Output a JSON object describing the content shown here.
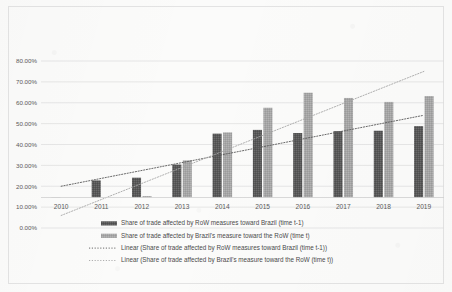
{
  "chart_data": {
    "type": "bar",
    "title": "",
    "xlabel": "",
    "ylabel": "",
    "ylim": [
      0,
      80
    ],
    "ytick_labels": [
      "0.00%",
      "10.00%",
      "20.00%",
      "30.00%",
      "40.00%",
      "50.00%",
      "60.00%",
      "70.00%",
      "80.00%"
    ],
    "ytick_values": [
      0,
      10,
      20,
      30,
      40,
      50,
      60,
      70,
      80
    ],
    "grid": true,
    "legend_position": "bottom",
    "categories": [
      "2010",
      "2011",
      "2012",
      "2013",
      "2014",
      "2015",
      "2016",
      "2017",
      "2018",
      "2019"
    ],
    "series": [
      {
        "name": "Share of trade affected by RoW measures toward Brazil (time t-1)",
        "type": "bar",
        "color": "#595959",
        "values": [
          14.7,
          22.8,
          24.1,
          30.4,
          45.2,
          47.0,
          45.5,
          46.4,
          46.6,
          48.8
        ]
      },
      {
        "name": "Share of trade affected by Brazil's measure toward the RoW (time t)",
        "type": "bar",
        "color": "#a6a6a6",
        "values": [
          3.8,
          6.5,
          15.3,
          32.4,
          45.8,
          57.6,
          64.8,
          62.3,
          60.4,
          63.2
        ]
      },
      {
        "name": "Linear (Share of trade affected by RoW measures toward Brazil (time t-1))",
        "type": "trendline",
        "color": "#595959",
        "style": "dotted",
        "endpoints": [
          20.0,
          54.0
        ]
      },
      {
        "name": "Linear (Share of trade affected by Brazil's measure toward the RoW (time t))",
        "type": "trendline",
        "color": "#a6a6a6",
        "style": "dotted",
        "endpoints": [
          6.0,
          75.0
        ]
      }
    ]
  },
  "legend": {
    "items": [
      {
        "label": "Share of trade affected by RoW measures toward Brazil (time t-1)",
        "marker": "bar-swatch",
        "color": "#595959"
      },
      {
        "label": "Share of trade affected by Brazil's measure toward the RoW (time t)",
        "marker": "bar-swatch",
        "color": "#a6a6a6"
      },
      {
        "label": "Linear (Share of trade affected by RoW measures toward Brazil (time t-1))",
        "marker": "dotted-line",
        "color": "#595959"
      },
      {
        "label": "Linear (Share of trade affected by Brazil's measure toward the RoW (time t))",
        "marker": "dotted-line",
        "color": "#a6a6a6"
      }
    ]
  }
}
